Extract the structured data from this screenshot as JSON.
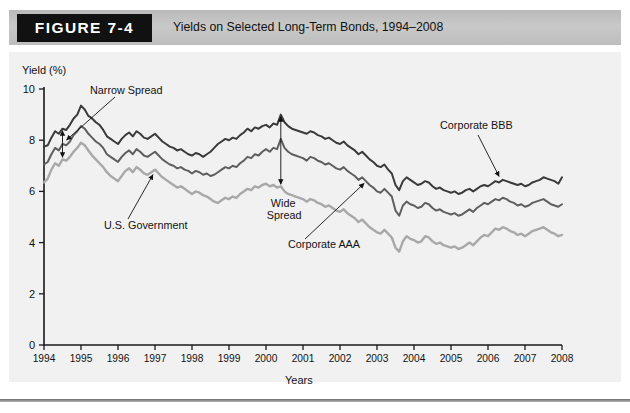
{
  "figure": {
    "badge_label": "FIGURE 7-4",
    "title": "Yields on Selected Long-Term Bonds, 1994–2008"
  },
  "chart_data": {
    "type": "line",
    "title": "Yields on Selected Long-Term Bonds, 1994–2008",
    "xlabel": "Years",
    "ylabel": "Yield (%)",
    "xlim": [
      1994,
      2008
    ],
    "ylim": [
      0,
      10
    ],
    "yticks": [
      0,
      2,
      4,
      6,
      8,
      10
    ],
    "xticks": [
      1994,
      1995,
      1996,
      1997,
      1998,
      1999,
      2000,
      2001,
      2002,
      2003,
      2004,
      2005,
      2006,
      2007,
      2008
    ],
    "grid": false,
    "legend_position": "none",
    "annotations": [
      {
        "id": "narrow-spread",
        "text": "Narrow Spread",
        "kind": "double-arrow",
        "x": 1994.5
      },
      {
        "id": "us-government",
        "text": "U.S. Government",
        "kind": "leader",
        "x": 1997.0
      },
      {
        "id": "wide-spread",
        "text": "Wide Spread",
        "kind": "double-arrow",
        "x": 2000.4
      },
      {
        "id": "corporate-aaa",
        "text": "Corporate AAA",
        "kind": "leader",
        "x": 2002.6
      },
      {
        "id": "corporate-bbb",
        "text": "Corporate BBB",
        "kind": "leader",
        "x": 2006.3
      }
    ],
    "x": [
      1994.0,
      1994.1,
      1994.2,
      1994.3,
      1994.4,
      1994.5,
      1994.6,
      1994.7,
      1994.8,
      1994.9,
      1995.0,
      1995.1,
      1995.2,
      1995.3,
      1995.4,
      1995.5,
      1995.6,
      1995.7,
      1995.8,
      1995.9,
      1996.0,
      1996.1,
      1996.2,
      1996.3,
      1996.4,
      1996.5,
      1996.6,
      1996.7,
      1996.8,
      1996.9,
      1997.0,
      1997.1,
      1997.2,
      1997.3,
      1997.4,
      1997.5,
      1997.6,
      1997.7,
      1997.8,
      1997.9,
      1998.0,
      1998.1,
      1998.2,
      1998.3,
      1998.4,
      1998.5,
      1998.6,
      1998.7,
      1998.8,
      1998.9,
      1999.0,
      1999.1,
      1999.2,
      1999.3,
      1999.4,
      1999.5,
      1999.6,
      1999.7,
      1999.8,
      1999.9,
      2000.0,
      2000.1,
      2000.2,
      2000.3,
      2000.4,
      2000.5,
      2000.6,
      2000.7,
      2000.8,
      2000.9,
      2001.0,
      2001.1,
      2001.2,
      2001.3,
      2001.4,
      2001.5,
      2001.6,
      2001.7,
      2001.8,
      2001.9,
      2002.0,
      2002.1,
      2002.2,
      2002.3,
      2002.4,
      2002.5,
      2002.6,
      2002.7,
      2002.8,
      2002.9,
      2003.0,
      2003.1,
      2003.2,
      2003.3,
      2003.4,
      2003.5,
      2003.6,
      2003.7,
      2003.8,
      2003.9,
      2004.0,
      2004.1,
      2004.2,
      2004.3,
      2004.4,
      2004.5,
      2004.6,
      2004.7,
      2004.8,
      2004.9,
      2005.0,
      2005.1,
      2005.2,
      2005.3,
      2005.4,
      2005.5,
      2005.6,
      2005.7,
      2005.8,
      2005.9,
      2006.0,
      2006.1,
      2006.2,
      2006.3,
      2006.4,
      2006.5,
      2006.6,
      2006.7,
      2006.8,
      2006.9,
      2007.0,
      2007.1,
      2007.2,
      2007.3,
      2007.4,
      2007.5,
      2007.6,
      2007.7,
      2007.8,
      2007.9,
      2008.0
    ],
    "series": [
      {
        "name": "Corporate BBB",
        "color": "#3a3a3a",
        "width": 2.0,
        "values": [
          7.75,
          7.8,
          8.1,
          8.35,
          8.25,
          8.45,
          8.4,
          8.6,
          8.85,
          9.0,
          9.35,
          9.2,
          8.95,
          8.85,
          8.7,
          8.6,
          8.4,
          8.15,
          8.05,
          7.95,
          7.85,
          8.05,
          8.2,
          8.3,
          8.15,
          8.35,
          8.25,
          8.1,
          8.05,
          8.15,
          8.25,
          8.1,
          7.95,
          7.85,
          7.75,
          7.7,
          7.6,
          7.65,
          7.55,
          7.45,
          7.4,
          7.5,
          7.45,
          7.35,
          7.45,
          7.55,
          7.7,
          7.85,
          7.95,
          8.05,
          8.0,
          8.1,
          8.05,
          8.2,
          8.3,
          8.45,
          8.35,
          8.5,
          8.45,
          8.55,
          8.6,
          8.5,
          8.65,
          8.6,
          9.0,
          8.7,
          8.55,
          8.45,
          8.4,
          8.35,
          8.3,
          8.25,
          8.35,
          8.3,
          8.2,
          8.15,
          8.05,
          8.1,
          8.0,
          7.9,
          7.85,
          7.95,
          7.8,
          7.7,
          7.6,
          7.45,
          7.55,
          7.4,
          7.25,
          7.15,
          7.0,
          6.95,
          7.05,
          6.85,
          6.7,
          6.25,
          6.05,
          6.4,
          6.55,
          6.45,
          6.35,
          6.25,
          6.3,
          6.4,
          6.35,
          6.2,
          6.1,
          6.15,
          6.05,
          6.0,
          5.95,
          6.0,
          5.9,
          5.95,
          6.05,
          6.1,
          6.0,
          6.1,
          6.2,
          6.25,
          6.2,
          6.3,
          6.4,
          6.35,
          6.45,
          6.4,
          6.35,
          6.3,
          6.25,
          6.3,
          6.2,
          6.25,
          6.35,
          6.4,
          6.45,
          6.55,
          6.5,
          6.45,
          6.4,
          6.3,
          6.55
        ]
      },
      {
        "name": "Corporate AAA",
        "color": "#5e5e5e",
        "width": 2.0,
        "values": [
          7.05,
          7.15,
          7.45,
          7.7,
          7.6,
          7.85,
          7.8,
          7.95,
          8.2,
          8.35,
          8.55,
          8.45,
          8.25,
          8.1,
          7.95,
          7.85,
          7.7,
          7.45,
          7.35,
          7.25,
          7.15,
          7.35,
          7.5,
          7.6,
          7.45,
          7.65,
          7.55,
          7.4,
          7.35,
          7.45,
          7.55,
          7.4,
          7.25,
          7.15,
          7.05,
          7.0,
          6.9,
          6.95,
          6.85,
          6.8,
          6.7,
          6.8,
          6.75,
          6.65,
          6.7,
          6.6,
          6.65,
          6.75,
          6.85,
          6.95,
          6.9,
          7.0,
          6.95,
          7.1,
          7.2,
          7.35,
          7.3,
          7.45,
          7.4,
          7.55,
          7.65,
          7.55,
          7.7,
          7.65,
          8.05,
          7.7,
          7.55,
          7.45,
          7.4,
          7.35,
          7.3,
          7.2,
          7.35,
          7.3,
          7.2,
          7.15,
          7.05,
          7.1,
          7.0,
          6.9,
          6.85,
          6.95,
          6.8,
          6.7,
          6.6,
          6.45,
          6.55,
          6.4,
          6.25,
          6.15,
          6.0,
          5.95,
          6.1,
          5.95,
          5.8,
          5.25,
          5.05,
          5.45,
          5.6,
          5.5,
          5.45,
          5.35,
          5.4,
          5.55,
          5.5,
          5.35,
          5.25,
          5.3,
          5.2,
          5.15,
          5.1,
          5.15,
          5.05,
          5.1,
          5.2,
          5.3,
          5.2,
          5.35,
          5.45,
          5.55,
          5.5,
          5.6,
          5.7,
          5.65,
          5.75,
          5.7,
          5.6,
          5.55,
          5.45,
          5.5,
          5.4,
          5.45,
          5.55,
          5.6,
          5.65,
          5.7,
          5.6,
          5.5,
          5.45,
          5.4,
          5.5
        ]
      },
      {
        "name": "U.S. Government",
        "color": "#a8a8a8",
        "width": 2.4,
        "values": [
          6.35,
          6.5,
          6.85,
          7.1,
          7.0,
          7.25,
          7.2,
          7.35,
          7.55,
          7.7,
          7.9,
          7.8,
          7.6,
          7.4,
          7.25,
          7.1,
          6.95,
          6.75,
          6.6,
          6.5,
          6.4,
          6.6,
          6.8,
          6.9,
          6.75,
          6.95,
          6.85,
          6.7,
          6.65,
          6.75,
          6.85,
          6.7,
          6.55,
          6.45,
          6.35,
          6.25,
          6.15,
          6.2,
          6.1,
          6.0,
          5.9,
          6.0,
          5.95,
          5.85,
          5.8,
          5.7,
          5.6,
          5.55,
          5.65,
          5.75,
          5.7,
          5.8,
          5.75,
          5.9,
          6.0,
          6.1,
          6.05,
          6.2,
          6.15,
          6.25,
          6.3,
          6.2,
          6.25,
          6.15,
          6.2,
          6.0,
          5.9,
          5.85,
          5.8,
          5.75,
          5.7,
          5.6,
          5.7,
          5.65,
          5.55,
          5.5,
          5.4,
          5.45,
          5.35,
          5.25,
          5.2,
          5.3,
          5.15,
          5.05,
          4.95,
          4.8,
          4.9,
          4.75,
          4.6,
          4.5,
          4.4,
          4.35,
          4.5,
          4.35,
          4.2,
          3.8,
          3.65,
          4.05,
          4.25,
          4.15,
          4.1,
          4.0,
          4.05,
          4.25,
          4.2,
          4.05,
          3.95,
          4.0,
          3.9,
          3.85,
          3.8,
          3.85,
          3.75,
          3.8,
          3.9,
          4.0,
          3.9,
          4.05,
          4.2,
          4.3,
          4.25,
          4.4,
          4.55,
          4.5,
          4.6,
          4.55,
          4.45,
          4.4,
          4.3,
          4.35,
          4.25,
          4.35,
          4.45,
          4.5,
          4.55,
          4.6,
          4.5,
          4.4,
          4.35,
          4.25,
          4.3
        ]
      }
    ]
  }
}
